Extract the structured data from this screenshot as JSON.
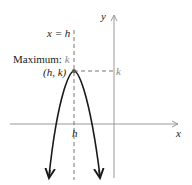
{
  "diagram": {
    "axes": {
      "x_label": "x",
      "y_label": "y"
    },
    "axis_of_symmetry_label": "x = h",
    "maximum_label_prefix": "Maximum: ",
    "maximum_label_value": "k",
    "vertex_label": "(h, k)",
    "y_tick_label": "k",
    "x_tick_label": "h",
    "colors": {
      "curve": "#1a1a1a",
      "axes": "#999999",
      "dashed": "#777777",
      "text": "#222222",
      "accent_text": "#888888"
    }
  }
}
